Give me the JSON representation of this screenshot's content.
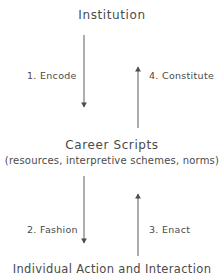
{
  "diagram": {
    "title": "Institution",
    "type": "cycle-diagram",
    "line_color": "#5a5a5a",
    "text_color": "#4a4a4a",
    "background_color": "#ffffff",
    "nodes": [
      {
        "id": "institution",
        "label": "Institution"
      },
      {
        "id": "career-scripts",
        "label": "Career Scripts",
        "sublabel": "(resources, interpretive schemes, norms)"
      },
      {
        "id": "individual-action",
        "label": "Individual Action and Interaction"
      }
    ],
    "edges": [
      {
        "id": "encode",
        "label": "1. Encode",
        "from": "institution",
        "to": "career-scripts",
        "direction": "down"
      },
      {
        "id": "constitute",
        "label": "4. Constitute",
        "from": "career-scripts",
        "to": "institution",
        "direction": "up"
      },
      {
        "id": "fashion",
        "label": "2. Fashion",
        "from": "career-scripts",
        "to": "individual-action",
        "direction": "down"
      },
      {
        "id": "enact",
        "label": "3. Enact",
        "from": "individual-action",
        "to": "career-scripts",
        "direction": "up"
      }
    ]
  }
}
